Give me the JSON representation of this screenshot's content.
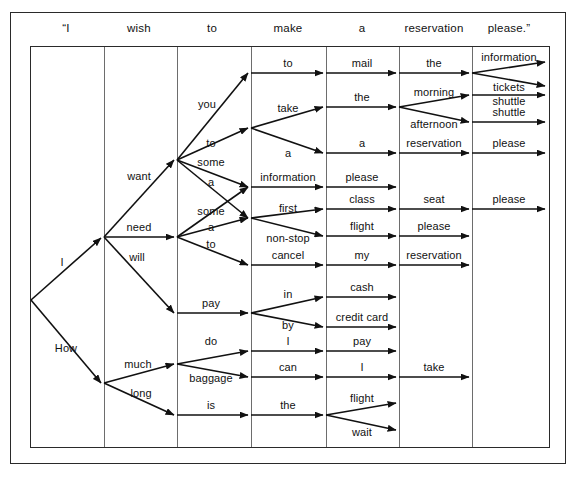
{
  "figure": {
    "type": "word-lattice-network",
    "title_words": [
      "“I",
      "wish",
      "to",
      "make",
      "a",
      "reservation",
      "please.”"
    ],
    "columns": 7,
    "line_color": "#111111",
    "grid_color": "#6d6d6d",
    "frame_color": "#2a2a2a"
  },
  "header": {
    "words": [
      {
        "text": "“I",
        "cx": 66
      },
      {
        "text": "wish",
        "cx": 139
      },
      {
        "text": "to",
        "cx": 212
      },
      {
        "text": "make",
        "cx": 288
      },
      {
        "text": "a",
        "cx": 362
      },
      {
        "text": "reservation",
        "cx": 434
      },
      {
        "text": "please.”",
        "cx": 509
      }
    ]
  },
  "grid": {
    "left": 30,
    "top": 46,
    "width": 518,
    "height": 400,
    "column_x": [
      30,
      103,
      176,
      250,
      325,
      398,
      471,
      548
    ]
  },
  "edges": [
    {
      "label": "I",
      "x1": 31,
      "y1": 300,
      "x2": 101,
      "y2": 238,
      "lx": 62,
      "ly": 262
    },
    {
      "label": "How",
      "x1": 31,
      "y1": 300,
      "x2": 101,
      "y2": 383,
      "lx": 66,
      "ly": 348
    },
    {
      "label": "want",
      "x1": 104,
      "y1": 237,
      "x2": 174,
      "y2": 160,
      "lx": 139,
      "ly": 176
    },
    {
      "label": "need",
      "x1": 104,
      "y1": 237,
      "x2": 174,
      "y2": 237,
      "lx": 139,
      "ly": 227
    },
    {
      "label": "will",
      "x1": 104,
      "y1": 237,
      "x2": 174,
      "y2": 313,
      "lx": 137,
      "ly": 257
    },
    {
      "label": "much",
      "x1": 104,
      "y1": 383,
      "x2": 174,
      "y2": 364,
      "lx": 138,
      "ly": 364
    },
    {
      "label": "long",
      "x1": 104,
      "y1": 383,
      "x2": 174,
      "y2": 415,
      "lx": 141,
      "ly": 393
    },
    {
      "label": "you",
      "x1": 177,
      "y1": 160,
      "x2": 248,
      "y2": 73,
      "lx": 207,
      "ly": 104
    },
    {
      "label": "to",
      "x1": 177,
      "y1": 160,
      "x2": 248,
      "y2": 128,
      "lx": 211,
      "ly": 143
    },
    {
      "label": "some",
      "x1": 177,
      "y1": 160,
      "x2": 248,
      "y2": 218,
      "lx": 211,
      "ly": 162
    },
    {
      "label": "a",
      "x1": 177,
      "y1": 160,
      "x2": 248,
      "y2": 187,
      "lx": 211,
      "ly": 182
    },
    {
      "label": "some",
      "x1": 177,
      "y1": 237,
      "x2": 248,
      "y2": 187,
      "lx": 211,
      "ly": 211
    },
    {
      "label": "a",
      "x1": 177,
      "y1": 237,
      "x2": 248,
      "y2": 218,
      "lx": 211,
      "ly": 227
    },
    {
      "label": "to",
      "x1": 177,
      "y1": 237,
      "x2": 248,
      "y2": 265,
      "lx": 211,
      "ly": 244
    },
    {
      "label": "pay",
      "x1": 177,
      "y1": 313,
      "x2": 248,
      "y2": 313,
      "lx": 211,
      "ly": 303
    },
    {
      "label": "do",
      "x1": 177,
      "y1": 364,
      "x2": 248,
      "y2": 351,
      "lx": 211,
      "ly": 341
    },
    {
      "label": "baggage",
      "x1": 177,
      "y1": 364,
      "x2": 248,
      "y2": 377,
      "lx": 211,
      "ly": 378
    },
    {
      "label": "is",
      "x1": 177,
      "y1": 415,
      "x2": 248,
      "y2": 415,
      "lx": 211,
      "ly": 405
    },
    {
      "label": "to",
      "x1": 251,
      "y1": 73,
      "x2": 323,
      "y2": 73,
      "lx": 288,
      "ly": 63
    },
    {
      "label": "take",
      "x1": 251,
      "y1": 128,
      "x2": 323,
      "y2": 107,
      "lx": 288,
      "ly": 108
    },
    {
      "label": "a",
      "x1": 251,
      "y1": 128,
      "x2": 323,
      "y2": 153,
      "lx": 288,
      "ly": 153
    },
    {
      "label": "information",
      "x1": 251,
      "y1": 187,
      "x2": 323,
      "y2": 187,
      "lx": 288,
      "ly": 177
    },
    {
      "label": "first",
      "x1": 251,
      "y1": 218,
      "x2": 323,
      "y2": 209,
      "lx": 288,
      "ly": 208
    },
    {
      "label": "non-stop",
      "x1": 251,
      "y1": 218,
      "x2": 323,
      "y2": 236,
      "lx": 288,
      "ly": 238
    },
    {
      "label": "cancel",
      "x1": 251,
      "y1": 265,
      "x2": 323,
      "y2": 265,
      "lx": 288,
      "ly": 255
    },
    {
      "label": "in",
      "x1": 251,
      "y1": 313,
      "x2": 323,
      "y2": 297,
      "lx": 288,
      "ly": 294
    },
    {
      "label": "by",
      "x1": 251,
      "y1": 313,
      "x2": 323,
      "y2": 327,
      "lx": 288,
      "ly": 325
    },
    {
      "label": "I",
      "x1": 251,
      "y1": 351,
      "x2": 323,
      "y2": 351,
      "lx": 288,
      "ly": 341
    },
    {
      "label": "can",
      "x1": 251,
      "y1": 377,
      "x2": 323,
      "y2": 377,
      "lx": 288,
      "ly": 367
    },
    {
      "label": "the",
      "x1": 251,
      "y1": 415,
      "x2": 323,
      "y2": 415,
      "lx": 288,
      "ly": 405
    },
    {
      "label": "mail",
      "x1": 326,
      "y1": 73,
      "x2": 396,
      "y2": 73,
      "lx": 362,
      "ly": 63
    },
    {
      "label": "the",
      "x1": 326,
      "y1": 107,
      "x2": 396,
      "y2": 107,
      "lx": 362,
      "ly": 97
    },
    {
      "label": "a",
      "x1": 326,
      "y1": 153,
      "x2": 396,
      "y2": 153,
      "lx": 362,
      "ly": 143
    },
    {
      "label": "please",
      "x1": 326,
      "y1": 187,
      "x2": 396,
      "y2": 187,
      "lx": 362,
      "ly": 177
    },
    {
      "label": "class",
      "x1": 326,
      "y1": 209,
      "x2": 396,
      "y2": 209,
      "lx": 362,
      "ly": 199
    },
    {
      "label": "flight",
      "x1": 326,
      "y1": 236,
      "x2": 396,
      "y2": 236,
      "lx": 362,
      "ly": 226
    },
    {
      "label": "my",
      "x1": 326,
      "y1": 265,
      "x2": 396,
      "y2": 265,
      "lx": 362,
      "ly": 255
    },
    {
      "label": "cash",
      "x1": 326,
      "y1": 297,
      "x2": 396,
      "y2": 297,
      "lx": 362,
      "ly": 287
    },
    {
      "label": "credit card",
      "x1": 326,
      "y1": 327,
      "x2": 396,
      "y2": 327,
      "lx": 362,
      "ly": 317
    },
    {
      "label": "pay",
      "x1": 326,
      "y1": 351,
      "x2": 396,
      "y2": 351,
      "lx": 362,
      "ly": 341
    },
    {
      "label": "I",
      "x1": 326,
      "y1": 377,
      "x2": 396,
      "y2": 377,
      "lx": 362,
      "ly": 367
    },
    {
      "label": "flight",
      "x1": 326,
      "y1": 415,
      "x2": 396,
      "y2": 403,
      "lx": 362,
      "ly": 398
    },
    {
      "label": "wait",
      "x1": 326,
      "y1": 415,
      "x2": 396,
      "y2": 430,
      "lx": 362,
      "ly": 432
    },
    {
      "label": "the",
      "x1": 399,
      "y1": 73,
      "x2": 469,
      "y2": 73,
      "lx": 434,
      "ly": 63
    },
    {
      "label": "morning",
      "x1": 399,
      "y1": 107,
      "x2": 469,
      "y2": 95,
      "lx": 434,
      "ly": 92
    },
    {
      "label": "afternoon",
      "x1": 399,
      "y1": 107,
      "x2": 469,
      "y2": 122,
      "lx": 434,
      "ly": 124
    },
    {
      "label": "reservation",
      "x1": 399,
      "y1": 153,
      "x2": 469,
      "y2": 153,
      "lx": 434,
      "ly": 143
    },
    {
      "label": "seat",
      "x1": 399,
      "y1": 209,
      "x2": 469,
      "y2": 209,
      "lx": 434,
      "ly": 199
    },
    {
      "label": "please",
      "x1": 399,
      "y1": 236,
      "x2": 469,
      "y2": 236,
      "lx": 434,
      "ly": 226
    },
    {
      "label": "reservation",
      "x1": 399,
      "y1": 265,
      "x2": 469,
      "y2": 265,
      "lx": 434,
      "ly": 255
    },
    {
      "label": "take",
      "x1": 399,
      "y1": 377,
      "x2": 469,
      "y2": 377,
      "lx": 434,
      "ly": 367
    },
    {
      "label": "information",
      "x1": 472,
      "y1": 73,
      "x2": 545,
      "y2": 62,
      "lx": 509,
      "ly": 57
    },
    {
      "label": "tickets",
      "x1": 472,
      "y1": 73,
      "x2": 545,
      "y2": 86,
      "lx": 509,
      "ly": 87
    },
    {
      "label": "shuttle",
      "x1": 472,
      "y1": 95,
      "x2": 545,
      "y2": 95,
      "lx": 509,
      "ly": 101
    },
    {
      "label": "shuttle",
      "x1": 472,
      "y1": 122,
      "x2": 545,
      "y2": 122,
      "lx": 509,
      "ly": 112
    },
    {
      "label": "please",
      "x1": 472,
      "y1": 153,
      "x2": 545,
      "y2": 153,
      "lx": 509,
      "ly": 143
    },
    {
      "label": "please",
      "x1": 472,
      "y1": 209,
      "x2": 545,
      "y2": 209,
      "lx": 509,
      "ly": 199
    }
  ]
}
